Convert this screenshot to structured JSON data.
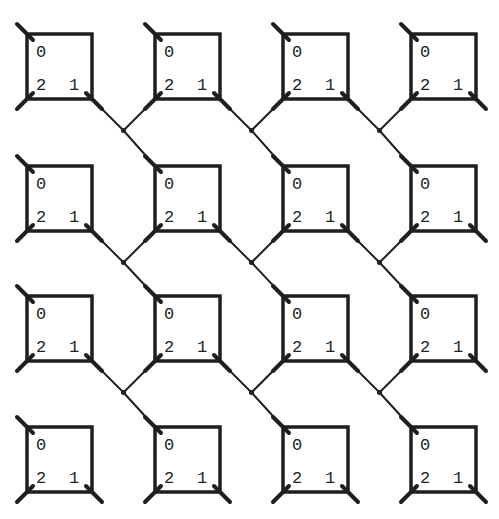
{
  "diagram": {
    "type": "interaction-net-grid",
    "rows": 4,
    "cols": 4,
    "box": {
      "width": 65,
      "height": 65
    },
    "col_x": [
      27,
      155,
      283,
      411
    ],
    "row_y": [
      34,
      166,
      296,
      427
    ],
    "port_labels": {
      "principal": "0",
      "right": "1",
      "left": "2"
    },
    "colors": {
      "stroke": "#1f1f1f",
      "background": "#ffffff"
    },
    "cells": [
      {
        "row": 0,
        "col": 0,
        "labels": [
          "0",
          "1",
          "2"
        ]
      },
      {
        "row": 0,
        "col": 1,
        "labels": [
          "0",
          "1",
          "2"
        ]
      },
      {
        "row": 0,
        "col": 2,
        "labels": [
          "0",
          "1",
          "2"
        ]
      },
      {
        "row": 0,
        "col": 3,
        "labels": [
          "0",
          "1",
          "2"
        ]
      },
      {
        "row": 1,
        "col": 0,
        "labels": [
          "0",
          "1",
          "2"
        ]
      },
      {
        "row": 1,
        "col": 1,
        "labels": [
          "0",
          "1",
          "2"
        ]
      },
      {
        "row": 1,
        "col": 2,
        "labels": [
          "0",
          "1",
          "2"
        ]
      },
      {
        "row": 1,
        "col": 3,
        "labels": [
          "0",
          "1",
          "2"
        ]
      },
      {
        "row": 2,
        "col": 0,
        "labels": [
          "0",
          "1",
          "2"
        ]
      },
      {
        "row": 2,
        "col": 1,
        "labels": [
          "0",
          "1",
          "2"
        ]
      },
      {
        "row": 2,
        "col": 2,
        "labels": [
          "0",
          "1",
          "2"
        ]
      },
      {
        "row": 2,
        "col": 3,
        "labels": [
          "0",
          "1",
          "2"
        ]
      },
      {
        "row": 3,
        "col": 0,
        "labels": [
          "0",
          "1",
          "2"
        ]
      },
      {
        "row": 3,
        "col": 1,
        "labels": [
          "0",
          "1",
          "2"
        ]
      },
      {
        "row": 3,
        "col": 2,
        "labels": [
          "0",
          "1",
          "2"
        ]
      },
      {
        "row": 3,
        "col": 3,
        "labels": [
          "0",
          "1",
          "2"
        ]
      }
    ],
    "connections_note": "Port 1 of cell (r,c) and port 2 of cell (r,c+1) meet at a junction dot that continues to port 0 of cell (r+1,c+1)"
  }
}
